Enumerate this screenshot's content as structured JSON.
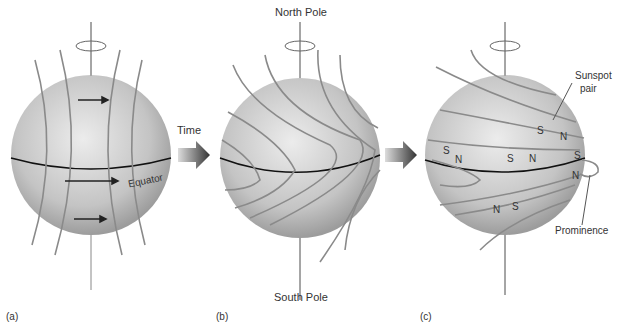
{
  "panels": [
    {
      "id": "a",
      "label": "(a)"
    },
    {
      "id": "b",
      "label": "(b)"
    },
    {
      "id": "c",
      "label": "(c)"
    }
  ],
  "labels": {
    "time": "Time",
    "equator": "Equator",
    "north_pole": "North Pole",
    "south_pole": "South Pole",
    "sunspot_pair": "Sunspot\npair",
    "sunspot_pair_line1": "Sunspot",
    "sunspot_pair_line2": "pair",
    "prominence": "Prominence"
  },
  "polarity_marks": [
    {
      "text": "S"
    },
    {
      "text": "N"
    },
    {
      "text": "S"
    },
    {
      "text": "N"
    },
    {
      "text": "S"
    },
    {
      "text": "N"
    },
    {
      "text": "S"
    },
    {
      "text": "N"
    },
    {
      "text": "N"
    },
    {
      "text": "S"
    }
  ],
  "colors": {
    "field_line": "#8a8a8a",
    "equator": "#111111",
    "sphere_light": "#e8e8e8",
    "sphere_dark": "#9a9a9a",
    "arrow": "#333333"
  }
}
